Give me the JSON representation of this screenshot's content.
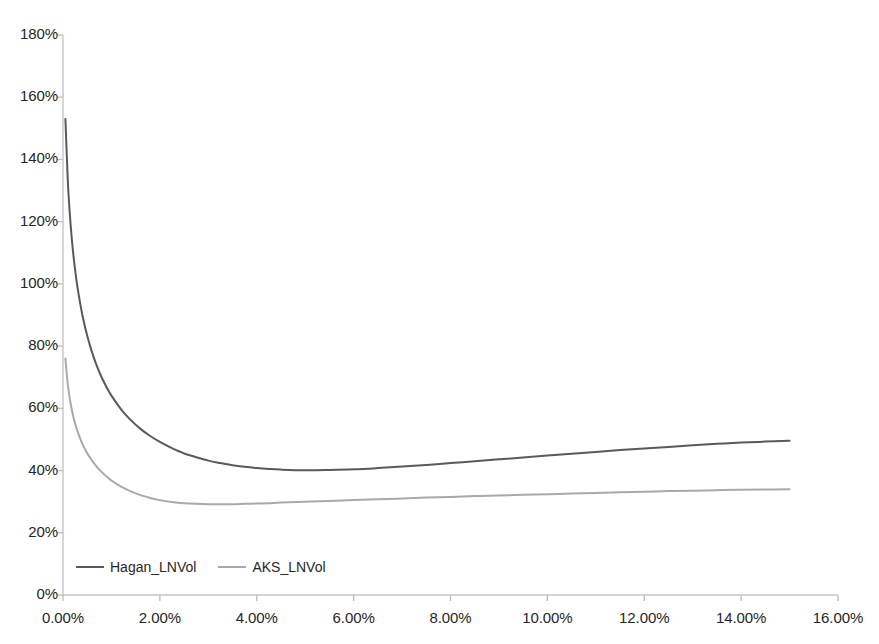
{
  "chart_data": {
    "type": "line",
    "title": "",
    "subtitle": "",
    "xlabel": "",
    "ylabel": "",
    "xlim": [
      0,
      16
    ],
    "ylim": [
      0,
      180
    ],
    "grid": false,
    "legend_position": "inside-bottom-left",
    "x_tick_labels": [
      "0.00%",
      "2.00%",
      "4.00%",
      "6.00%",
      "8.00%",
      "10.00%",
      "12.00%",
      "14.00%",
      "16.00%"
    ],
    "x_tick_values": [
      0,
      2,
      4,
      6,
      8,
      10,
      12,
      14,
      16
    ],
    "y_tick_labels": [
      "0%",
      "20%",
      "40%",
      "60%",
      "80%",
      "100%",
      "120%",
      "140%",
      "160%",
      "180%"
    ],
    "y_tick_values": [
      0,
      20,
      40,
      60,
      80,
      100,
      120,
      140,
      160,
      180
    ],
    "x_unit": "percent",
    "y_unit": "percent",
    "colors": {
      "hagan": "#5a5a5a",
      "aks": "#a9a9a9",
      "axis": "#bfbfbf",
      "text": "#262626",
      "background": "#ffffff"
    },
    "series": [
      {
        "name": "Hagan_LNVol",
        "color": "#5a5a5a",
        "x": [
          0.05,
          0.1,
          0.15,
          0.2,
          0.25,
          0.3,
          0.4,
          0.5,
          0.6,
          0.7,
          0.8,
          0.9,
          1.0,
          1.2,
          1.4,
          1.6,
          1.8,
          2.0,
          2.25,
          2.5,
          2.75,
          3.0,
          3.25,
          3.5,
          3.75,
          4.0,
          4.25,
          4.5,
          5.0,
          5.5,
          6.0,
          6.5,
          7.0,
          7.5,
          8.0,
          8.5,
          9.0,
          9.5,
          10.0,
          10.5,
          11.0,
          11.5,
          12.0,
          12.5,
          13.0,
          13.5,
          14.0,
          14.5,
          15.0
        ],
        "y": [
          153.0,
          133.0,
          120.5,
          111.5,
          104.5,
          98.8,
          90.0,
          83.3,
          78.0,
          73.6,
          69.9,
          66.8,
          64.1,
          59.7,
          56.2,
          53.4,
          51.1,
          49.2,
          47.2,
          45.5,
          44.3,
          43.2,
          42.4,
          41.7,
          41.2,
          40.8,
          40.5,
          40.3,
          40.1,
          40.2,
          40.4,
          40.8,
          41.3,
          41.8,
          42.4,
          43.0,
          43.6,
          44.2,
          44.8,
          45.4,
          46.0,
          46.6,
          47.1,
          47.6,
          48.1,
          48.6,
          49.0,
          49.3,
          49.6
        ]
      },
      {
        "name": "AKS_LNVol",
        "color": "#a9a9a9",
        "x": [
          0.05,
          0.1,
          0.15,
          0.2,
          0.25,
          0.3,
          0.4,
          0.5,
          0.6,
          0.7,
          0.8,
          0.9,
          1.0,
          1.2,
          1.4,
          1.6,
          1.8,
          2.0,
          2.25,
          2.5,
          2.75,
          3.0,
          3.25,
          3.5,
          3.75,
          4.0,
          4.25,
          4.5,
          5.0,
          5.5,
          6.0,
          6.5,
          7.0,
          7.5,
          8.0,
          8.5,
          9.0,
          9.5,
          10.0,
          10.5,
          11.0,
          11.5,
          12.0,
          12.5,
          13.0,
          13.5,
          14.0,
          14.5,
          15.0
        ],
        "y": [
          76.0,
          67.5,
          62.2,
          58.2,
          55.1,
          52.6,
          48.6,
          45.6,
          43.2,
          41.2,
          39.5,
          38.1,
          36.8,
          34.8,
          33.3,
          32.1,
          31.2,
          30.5,
          29.9,
          29.5,
          29.3,
          29.2,
          29.2,
          29.2,
          29.3,
          29.4,
          29.5,
          29.7,
          30.0,
          30.2,
          30.5,
          30.8,
          31.0,
          31.3,
          31.5,
          31.8,
          32.0,
          32.2,
          32.4,
          32.6,
          32.8,
          33.0,
          33.2,
          33.4,
          33.5,
          33.7,
          33.8,
          33.9,
          34.0
        ]
      }
    ]
  },
  "legend": {
    "entries": [
      {
        "label": "Hagan_LNVol",
        "color": "#5a5a5a"
      },
      {
        "label": "AKS_LNVol",
        "color": "#a9a9a9"
      }
    ]
  }
}
